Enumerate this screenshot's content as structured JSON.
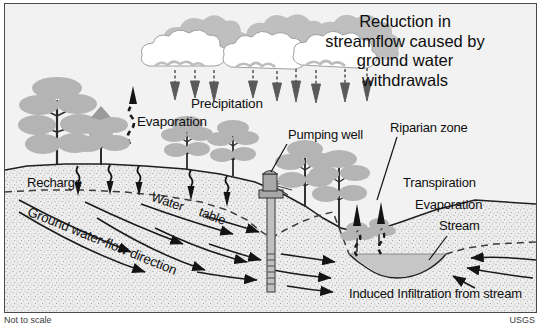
{
  "figure": {
    "title_lines": [
      "Reduction in",
      "streamflow caused by",
      "ground water",
      "withdrawals"
    ],
    "title_text": "Reduction in streamflow caused by ground water withdrawals",
    "corner_left": "Not to scale",
    "corner_right": "USGS"
  },
  "labels": {
    "precipitation": "Precipitation",
    "evaporation_left": "Evaporation",
    "pumping_well": "Pumping well",
    "riparian_zone": "Riparian zone",
    "transpiration": "Transpiration",
    "evaporation_right": "Evaporation",
    "stream": "Stream",
    "recharge": "Recharge",
    "water": "Water",
    "table": "table",
    "ground_water_flow": "Ground water-flow direction",
    "induced_infiltration": "Induced Infiltration from stream"
  },
  "colors": {
    "background": "#f2f2f2",
    "border": "#4a4a4a",
    "vegetation": "#b4b4b4",
    "vegetation_dark": "#9a9a9a",
    "cloud_light": "#ffffff",
    "cloud_shadow": "#bfbfbf",
    "soil_fill": "#ededed",
    "soil_stipple": "#8e8e8e",
    "water_fill": "#c6c6c6",
    "arrow_dark": "#1a1a1a",
    "arrow_gray": "#6e6e6e",
    "text": "#101010",
    "well_casing": "#c0c0c0",
    "well_head": "#a8a8a8"
  },
  "elements": {
    "clouds_count": 3,
    "precipitation_arrows": 9,
    "recharge_arrows": 6,
    "groundwater_flow_arrows": 11,
    "transpiration_arrows": 2,
    "trees_left": 2,
    "trees_upland": 4,
    "riparian_shrubs": 2,
    "stream_inflow_arrows_right": 2
  }
}
